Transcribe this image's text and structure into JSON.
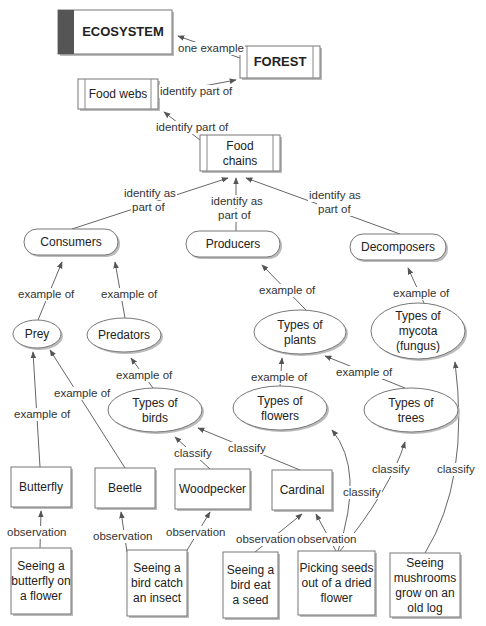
{
  "diagram": {
    "type": "concept-map",
    "nodes": [
      {
        "id": "ecosystem",
        "shape": "title-box",
        "lines": [
          "ECOSYSTEM"
        ],
        "x": 58,
        "y": 10,
        "w": 114,
        "h": 44
      },
      {
        "id": "forest",
        "shape": "tabbed-box",
        "lines": [
          "FOREST"
        ],
        "x": 240,
        "y": 46,
        "w": 80,
        "h": 32
      },
      {
        "id": "food-webs",
        "shape": "tabbed-box",
        "lines": [
          "Food webs"
        ],
        "x": 78,
        "y": 79,
        "w": 80,
        "h": 30
      },
      {
        "id": "food-chains",
        "shape": "tabbed-box",
        "lines": [
          "Food",
          "chains"
        ],
        "x": 200,
        "y": 135,
        "w": 80,
        "h": 36
      },
      {
        "id": "consumers",
        "shape": "pill",
        "lines": [
          "Consumers"
        ],
        "x": 24,
        "y": 229,
        "w": 94,
        "h": 26
      },
      {
        "id": "producers",
        "shape": "pill",
        "lines": [
          "Producers"
        ],
        "x": 186,
        "y": 231,
        "w": 94,
        "h": 26
      },
      {
        "id": "decomposers",
        "shape": "pill",
        "lines": [
          "Decomposers"
        ],
        "x": 350,
        "y": 234,
        "w": 96,
        "h": 26
      },
      {
        "id": "prey",
        "shape": "ellipse",
        "lines": [
          "Prey"
        ],
        "cx": 37,
        "cy": 334,
        "rx": 24,
        "ry": 14
      },
      {
        "id": "predators",
        "shape": "ellipse",
        "lines": [
          "Predators"
        ],
        "cx": 124,
        "cy": 335,
        "rx": 37,
        "ry": 17
      },
      {
        "id": "types-of-plants",
        "shape": "ellipse",
        "lines": [
          "Types of",
          "plants"
        ],
        "cx": 300,
        "cy": 332,
        "rx": 46,
        "ry": 22
      },
      {
        "id": "types-of-mycota",
        "shape": "ellipse",
        "lines": [
          "Types of",
          "mycota",
          "(fungus)"
        ],
        "cx": 418,
        "cy": 331,
        "rx": 47,
        "ry": 28
      },
      {
        "id": "types-of-birds",
        "shape": "ellipse",
        "lines": [
          "Types of",
          "birds"
        ],
        "cx": 155,
        "cy": 410,
        "rx": 47,
        "ry": 22
      },
      {
        "id": "types-of-flowers",
        "shape": "ellipse",
        "lines": [
          "Types of",
          "flowers"
        ],
        "cx": 280,
        "cy": 408,
        "rx": 47,
        "ry": 22
      },
      {
        "id": "types-of-trees",
        "shape": "ellipse",
        "lines": [
          "Types of",
          "trees"
        ],
        "cx": 411,
        "cy": 410,
        "rx": 47,
        "ry": 22
      },
      {
        "id": "butterfly",
        "shape": "box",
        "lines": [
          "Butterfly"
        ],
        "x": 11,
        "y": 467,
        "w": 60,
        "h": 40
      },
      {
        "id": "beetle",
        "shape": "box",
        "lines": [
          "Beetle"
        ],
        "x": 95,
        "y": 468,
        "w": 60,
        "h": 40
      },
      {
        "id": "woodpecker",
        "shape": "box",
        "lines": [
          "Woodpecker"
        ],
        "x": 175,
        "y": 469,
        "w": 75,
        "h": 40
      },
      {
        "id": "cardinal",
        "shape": "box",
        "lines": [
          "Cardinal"
        ],
        "x": 272,
        "y": 470,
        "w": 60,
        "h": 40
      },
      {
        "id": "obs-butterfly",
        "shape": "box",
        "lines": [
          "Seeing a",
          "butterfly on",
          "a flower"
        ],
        "x": 11,
        "y": 548,
        "w": 60,
        "h": 66
      },
      {
        "id": "obs-bird-insect",
        "shape": "box",
        "lines": [
          "Seeing a",
          "bird catch",
          "an insect"
        ],
        "x": 127,
        "y": 550,
        "w": 60,
        "h": 66
      },
      {
        "id": "obs-bird-seed",
        "shape": "box",
        "lines": [
          "Seeing a",
          "bird eat",
          "a seed"
        ],
        "x": 223,
        "y": 552,
        "w": 55,
        "h": 66
      },
      {
        "id": "obs-seeds",
        "shape": "box",
        "lines": [
          "Picking seeds",
          "out of a dried",
          "flower"
        ],
        "x": 298,
        "y": 551,
        "w": 77,
        "h": 64
      },
      {
        "id": "obs-mushrooms",
        "shape": "box",
        "lines": [
          "Seeing",
          "mushrooms",
          "grow on an",
          "old log"
        ],
        "x": 390,
        "y": 553,
        "w": 70,
        "h": 64
      }
    ],
    "edges": [
      {
        "from": "forest",
        "to": "ecosystem",
        "label": [
          "one example"
        ],
        "path": "M240,58 L178,36",
        "lx": 178,
        "ly": 52
      },
      {
        "from": "food-webs",
        "to": "forest",
        "label": [
          "identify part of"
        ],
        "path": "M160,94 L236,80",
        "lx": 160,
        "ly": 95
      },
      {
        "from": "food-chains",
        "to": "food-webs",
        "label": [
          "identify part of"
        ],
        "path": "M200,140 L164,112",
        "lx": 156,
        "ly": 131
      },
      {
        "from": "consumers",
        "to": "food-chains",
        "label": [
          "identify as",
          "part of"
        ],
        "path": "M72,229 L228,178",
        "lx": 124,
        "ly": 197,
        "l2x": 132,
        "l2y": 211
      },
      {
        "from": "producers",
        "to": "food-chains",
        "label": [
          "identify as",
          "part of"
        ],
        "path": "M236,231 L236,178",
        "lx": 211,
        "ly": 205,
        "l2x": 218,
        "l2y": 219
      },
      {
        "from": "decomposers",
        "to": "food-chains",
        "label": [
          "identify as",
          "part of"
        ],
        "path": "M400,234 L246,178",
        "lx": 309,
        "ly": 199,
        "l2x": 318,
        "l2y": 213
      },
      {
        "from": "prey",
        "to": "consumers",
        "label": [
          "example of"
        ],
        "path": "M38,320 L62,262",
        "lx": 18,
        "ly": 298
      },
      {
        "from": "predators",
        "to": "consumers",
        "label": [
          "example of"
        ],
        "path": "M125,318 L115,262",
        "lx": 101,
        "ly": 298
      },
      {
        "from": "types-of-plants",
        "to": "producers",
        "label": [
          "example of"
        ],
        "path": "M306,310 L262,265",
        "lx": 259,
        "ly": 294
      },
      {
        "from": "types-of-mycota",
        "to": "decomposers",
        "label": [
          "example of"
        ],
        "path": "M424,303 L408,268",
        "lx": 393,
        "ly": 297
      },
      {
        "from": "types-of-birds",
        "to": "predators",
        "label": [
          "example of"
        ],
        "path": "M153,388 L131,358",
        "lx": 116,
        "ly": 379
      },
      {
        "from": "types-of-flowers",
        "to": "types-of-plants",
        "label": [
          "example of"
        ],
        "path": "M280,386 L282,358",
        "lx": 251,
        "ly": 381
      },
      {
        "from": "types-of-trees",
        "to": "types-of-plants",
        "label": [
          "example of"
        ],
        "path": "M405,388 L325,356",
        "lx": 336,
        "ly": 376
      },
      {
        "from": "butterfly",
        "to": "prey",
        "label": [
          "example of"
        ],
        "path": "M40,467 L33,352",
        "lx": 14,
        "ly": 418
      },
      {
        "from": "beetle",
        "to": "prey",
        "label": [
          "example of"
        ],
        "path": "M125,468 L50,350",
        "lx": 54,
        "ly": 397
      },
      {
        "from": "woodpecker",
        "to": "types-of-birds",
        "label": [
          "classify"
        ],
        "path": "M210,469 L175,437",
        "lx": 174,
        "ly": 457
      },
      {
        "from": "cardinal",
        "to": "types-of-birds",
        "label": [
          "classify"
        ],
        "path": "M300,470 L198,428",
        "lx": 228,
        "ly": 452
      },
      {
        "from": "obs-seeds",
        "to": "types-of-flowers",
        "label": [
          "classify"
        ],
        "path": "M338,551 Q365,470 332,430",
        "lx": 343,
        "ly": 496
      },
      {
        "from": "obs-seeds",
        "to": "types-of-trees",
        "label": [
          "classify"
        ],
        "path": "M340,551 Q390,490 405,442",
        "lx": 372,
        "ly": 473
      },
      {
        "from": "obs-mushrooms",
        "to": "types-of-mycota",
        "label": [
          "classify"
        ],
        "path": "M425,553 Q470,480 455,362",
        "lx": 437,
        "ly": 473
      },
      {
        "from": "obs-butterfly",
        "to": "butterfly",
        "label": [
          "observation"
        ],
        "path": "M40,548 L41,511",
        "lx": 7,
        "ly": 536
      },
      {
        "from": "obs-bird-insect",
        "to": "beetle",
        "label": [
          "observation"
        ],
        "path": "M127,552 L121,512",
        "lx": 93,
        "ly": 540
      },
      {
        "from": "obs-bird-insect",
        "to": "woodpecker",
        "label": [
          "observation"
        ],
        "path": "M186,552 L210,512",
        "lx": 166,
        "ly": 536
      },
      {
        "from": "obs-bird-seed",
        "to": "cardinal",
        "label": [
          "observation"
        ],
        "path": "M255,552 L302,514",
        "lx": 236,
        "ly": 543
      },
      {
        "from": "obs-seeds",
        "to": "cardinal",
        "label": [
          "observation"
        ],
        "path": "M336,551 L316,514",
        "lx": 297,
        "ly": 543
      }
    ]
  }
}
